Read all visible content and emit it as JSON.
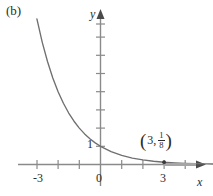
{
  "figure": {
    "panel_label": "(b)",
    "x_axis_name": "x",
    "y_axis_name": "y",
    "point_open_paren": "(",
    "point_x_value": "3",
    "point_comma": ",",
    "point_frac_numerator": "1",
    "point_frac_denominator": "8",
    "point_close_paren": ")",
    "colors": {
      "curve": "#6f6f6f",
      "axis": "#8a8a8a",
      "text": "#2b2b2b",
      "background": "#ffffff"
    }
  },
  "labels": {
    "x_neg3": "-3",
    "x_zero": "0",
    "x_three": "3",
    "y_one": "1"
  },
  "chart_data": {
    "type": "line",
    "title": "(b)",
    "xlabel": "x",
    "ylabel": "y",
    "function": "y = (1/2)^x",
    "xlim": [
      -4.6,
      6.2
    ],
    "ylim": [
      -0.6,
      8.8
    ],
    "grid": false,
    "legend": null,
    "x_ticks": [
      -4,
      -3,
      -2,
      -1,
      0,
      1,
      2,
      3,
      4
    ],
    "x_tick_labels": [
      "",
      "-3",
      "",
      "",
      "0",
      "",
      "",
      "3",
      ""
    ],
    "y_ticks": [
      1,
      2,
      3,
      4,
      5,
      6,
      7,
      8
    ],
    "y_tick_labels": [
      "1",
      "",
      "",
      "",
      "",
      "",
      "",
      ""
    ],
    "annotations": [
      {
        "label": "(3, 1/8)",
        "x": 3,
        "y": 0.125,
        "marker": "dot"
      }
    ],
    "series": [
      {
        "name": "y = (1/2)^x",
        "x": [
          -3.0,
          -2.75,
          -2.5,
          -2.25,
          -2.0,
          -1.75,
          -1.5,
          -1.25,
          -1.0,
          -0.75,
          -0.5,
          -0.25,
          0.0,
          0.5,
          1.0,
          1.5,
          2.0,
          2.5,
          3.0,
          3.5,
          4.0,
          4.5,
          5.0,
          5.5,
          6.0
        ],
        "y": [
          8.0,
          6.727,
          5.657,
          4.757,
          4.0,
          3.364,
          2.828,
          2.378,
          2.0,
          1.682,
          1.414,
          1.189,
          1.0,
          0.707,
          0.5,
          0.354,
          0.25,
          0.177,
          0.125,
          0.088,
          0.0625,
          0.044,
          0.031,
          0.022,
          0.016
        ]
      }
    ]
  }
}
